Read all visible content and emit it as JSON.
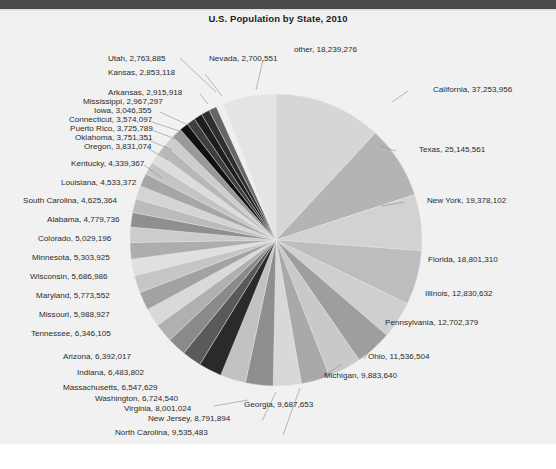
{
  "window": {
    "top_bar_color": "#4a4a4a",
    "figure_background": "#f1f1f1",
    "page_background": "#ffffff"
  },
  "chart": {
    "title": "U.S. Population by State, 2010"
  },
  "footer": {
    "caption": ""
  },
  "chart_data": {
    "type": "pie",
    "title": "U.S. Population by State, 2010",
    "xlabel": "",
    "ylabel": "",
    "legend_position": "none",
    "label_format": "name, value",
    "start_angle_deg": -90,
    "direction": "clockwise",
    "center": {
      "x": 276,
      "y": 240
    },
    "radius": 146,
    "labels": [
      "California",
      "Texas",
      "New York",
      "Florida",
      "Illinois",
      "Pennsylvania",
      "Ohio",
      "Michigan",
      "Georgia",
      "North Carolina",
      "New Jersey",
      "Virginia",
      "Washington",
      "Massachusetts",
      "Indiana",
      "Arizona",
      "Tennessee",
      "Missouri",
      "Maryland",
      "Wisconsin",
      "Minnesota",
      "Colorado",
      "Alabama",
      "South Carolina",
      "Louisiana",
      "Kentucky",
      "Oregon",
      "Oklahoma",
      "Puerto Rico",
      "Connecticut",
      "Iowa",
      "Mississippi",
      "Arkansas",
      "Kansas",
      "Utah",
      "Nevada",
      "other"
    ],
    "values": [
      37253956,
      25145561,
      19378102,
      18801310,
      12830632,
      12702379,
      11536504,
      9883640,
      9687653,
      9535483,
      8791894,
      8001024,
      6724540,
      6547629,
      6483802,
      6392017,
      6346105,
      5988927,
      5773552,
      5686986,
      5303925,
      5029196,
      4779736,
      4625364,
      4533372,
      4339367,
      3831074,
      3751351,
      3725789,
      3574097,
      3046355,
      2967297,
      2915918,
      2853118,
      2763885,
      2700551,
      18239276
    ],
    "slice_colors": [
      "#d6d6d6",
      "#b4b4b4",
      "#d2d2d2",
      "#bdbdbd",
      "#cfcfcf",
      "#9e9e9e",
      "#c9c9c9",
      "#a9a9a9",
      "#d8d8d8",
      "#8e8e8e",
      "#c2c2c2",
      "#2a2a2a",
      "#5a5a5a",
      "#8a8a8a",
      "#b0b0b0",
      "#d9d9d9",
      "#a2a2a2",
      "#c6c6c6",
      "#e0e0e0",
      "#adadad",
      "#cccccc",
      "#8f8f8f",
      "#bbbbbb",
      "#d4d4d4",
      "#a6a6a6",
      "#c4c4c4",
      "#dcdcdc",
      "#b8b8b8",
      "#cdcdcd",
      "#9a9a9a",
      "#111111",
      "#3f3f3f",
      "#1d1d1d",
      "#2e2e2e",
      "#666666",
      "#efefef",
      "#e4e4e4"
    ],
    "data_labels": [
      "California, 37,253,956",
      "Texas, 25,145,561",
      "New York, 19,378,102",
      "Florida, 18,801,310",
      "Illinois, 12,830,632",
      "Pennsylvania, 12,702,379",
      "Ohio, 11,536,504",
      "Michigan, 9,883,640",
      "Georgia, 9,687,653",
      "North Carolina, 9,535,483",
      "New Jersey, 8,791,894",
      "Virginia, 8,001,024",
      "Washington, 6,724,540",
      "Massachusetts, 6,547,629",
      "Indiana, 6,483,802",
      "Arizona, 6,392,017",
      "Tennessee, 6,346,105",
      "Missouri, 5,988,927",
      "Maryland, 5,773,552",
      "Wisconsin, 5,686,986",
      "Minnesota, 5,303,925",
      "Colorado, 5,029,196",
      "Alabama, 4,779,736",
      "South Carolina, 4,625,364",
      "Louisiana, 4,533,372",
      "Kentucky, 4,339,367",
      "Oregon, 3,831,074",
      "Oklahoma, 3,751,351",
      "Puerto Rico, 3,725,789",
      "Connecticut, 3,574,097",
      "Iowa, 3,046,355",
      "Mississippi, 2,967,297",
      "Arkansas, 2,915,918",
      "Kansas, 2,853,118",
      "Utah, 2,763,885",
      "Nevada, 2,700,551",
      "other, 18,239,276"
    ]
  },
  "label_positions": [
    {
      "key": "utah",
      "x": 108,
      "y": 54,
      "align": "left"
    },
    {
      "key": "nevada",
      "x": 209,
      "y": 54,
      "align": "left"
    },
    {
      "key": "other",
      "x": 294,
      "y": 45,
      "align": "left"
    },
    {
      "key": "kansas",
      "x": 108,
      "y": 68,
      "align": "left"
    },
    {
      "key": "california",
      "x": 433,
      "y": 85,
      "align": "left"
    },
    {
      "key": "arkansas",
      "x": 108,
      "y": 88,
      "align": "left"
    },
    {
      "key": "mississippi",
      "x": 83,
      "y": 97,
      "align": "left"
    },
    {
      "key": "iowa",
      "x": 94,
      "y": 106,
      "align": "left"
    },
    {
      "key": "connecticut",
      "x": 69,
      "y": 115,
      "align": "left"
    },
    {
      "key": "puerto_rico",
      "x": 70,
      "y": 124,
      "align": "left"
    },
    {
      "key": "oklahoma",
      "x": 75,
      "y": 133,
      "align": "left"
    },
    {
      "key": "oregon",
      "x": 84,
      "y": 142,
      "align": "left"
    },
    {
      "key": "texas",
      "x": 419,
      "y": 145,
      "align": "left"
    },
    {
      "key": "kentucky",
      "x": 71,
      "y": 159,
      "align": "left"
    },
    {
      "key": "louisiana",
      "x": 61,
      "y": 178,
      "align": "left"
    },
    {
      "key": "new_york",
      "x": 427,
      "y": 196,
      "align": "left"
    },
    {
      "key": "south_carolina",
      "x": 23,
      "y": 196,
      "align": "left"
    },
    {
      "key": "alabama",
      "x": 47,
      "y": 215,
      "align": "left"
    },
    {
      "key": "colorado",
      "x": 38,
      "y": 234,
      "align": "left"
    },
    {
      "key": "florida",
      "x": 428,
      "y": 255,
      "align": "left"
    },
    {
      "key": "minnesota",
      "x": 32,
      "y": 253,
      "align": "left"
    },
    {
      "key": "wisconsin",
      "x": 30,
      "y": 272,
      "align": "left"
    },
    {
      "key": "illinois",
      "x": 425,
      "y": 289,
      "align": "left"
    },
    {
      "key": "maryland",
      "x": 36,
      "y": 291,
      "align": "left"
    },
    {
      "key": "missouri",
      "x": 39,
      "y": 310,
      "align": "left"
    },
    {
      "key": "pennsylvania",
      "x": 385,
      "y": 318,
      "align": "left"
    },
    {
      "key": "tennessee",
      "x": 31,
      "y": 329,
      "align": "left"
    },
    {
      "key": "arizona",
      "x": 63,
      "y": 352,
      "align": "left"
    },
    {
      "key": "ohio",
      "x": 368,
      "y": 352,
      "align": "left"
    },
    {
      "key": "indiana",
      "x": 77,
      "y": 368,
      "align": "left"
    },
    {
      "key": "michigan",
      "x": 324,
      "y": 371,
      "align": "left"
    },
    {
      "key": "massachusetts",
      "x": 63,
      "y": 383,
      "align": "left"
    },
    {
      "key": "washington",
      "x": 95,
      "y": 394,
      "align": "left"
    },
    {
      "key": "georgia",
      "x": 244,
      "y": 400,
      "align": "left"
    },
    {
      "key": "virginia",
      "x": 124,
      "y": 404,
      "align": "left"
    },
    {
      "key": "new_jersey",
      "x": 148,
      "y": 414,
      "align": "left"
    },
    {
      "key": "north_carolina",
      "x": 115,
      "y": 428,
      "align": "left"
    }
  ]
}
